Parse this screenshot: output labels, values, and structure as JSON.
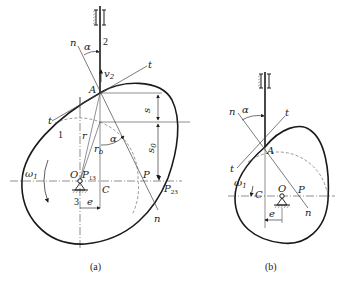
{
  "figure_a": {
    "caption": "(a)",
    "labels": {
      "follower": "2",
      "cam": "1",
      "frame": "3",
      "normal_top": "n",
      "normal_bottom": "n",
      "tangent_top": "t",
      "tangent_bottom": "t",
      "pressure_angle_top": "α",
      "pressure_angle_mid": "α",
      "velocity": "v",
      "velocity_sub": "2",
      "contact_point": "A",
      "radius": "r",
      "base_radius": "r",
      "base_radius_sub": "b",
      "displacement": "s",
      "initial_displacement": "s",
      "initial_displacement_sub": "0",
      "angular_velocity": "ω",
      "angular_velocity_sub": "1",
      "pivot": "O",
      "instant_center_13": "P",
      "instant_center_13_sub": "13",
      "foot_point": "C",
      "pole": "P",
      "instant_center_23": "P",
      "instant_center_23_sub": "23",
      "offset": "e"
    }
  },
  "figure_b": {
    "caption": "(b)",
    "labels": {
      "normal_top": "n",
      "normal_bottom": "n",
      "tangent_top": "t",
      "tangent_bottom": "t",
      "pressure_angle": "α",
      "contact_point": "A",
      "angular_velocity": "ω",
      "angular_velocity_sub": "1",
      "foot_point": "C",
      "pivot": "O",
      "pole": "P",
      "offset": "e"
    }
  },
  "colors": {
    "line": "#1a1a1a",
    "thin": "#444444",
    "hatch": "#555555"
  }
}
